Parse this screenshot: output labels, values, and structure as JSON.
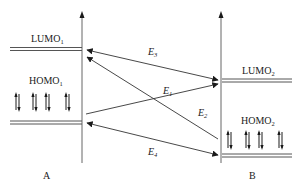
{
  "diagram": {
    "colors": {
      "line": "#555555",
      "axis": "#666666",
      "text": "#1a1a1a",
      "arrow": "#1a1a1a",
      "background": "#ffffff"
    },
    "molecules": [
      {
        "id": "A",
        "label": "A"
      },
      {
        "id": "B",
        "label": "B"
      }
    ],
    "levels": {
      "lumo1": {
        "base": "LUMO",
        "sub": "1"
      },
      "homo1": {
        "base": "HOMO",
        "sub": "1"
      },
      "lumo2": {
        "base": "LUMO",
        "sub": "2"
      },
      "homo2": {
        "base": "HOMO",
        "sub": "2"
      }
    },
    "transitions": [
      {
        "id": "E1",
        "base": "E",
        "sub": "1",
        "from": "HOMO1",
        "to": "LUMO2"
      },
      {
        "id": "E2",
        "base": "E",
        "sub": "2",
        "from": "HOMO2",
        "to": "LUMO1"
      },
      {
        "id": "E3",
        "base": "E",
        "sub": "3",
        "between": [
          "LUMO1",
          "LUMO2"
        ]
      },
      {
        "id": "E4",
        "base": "E",
        "sub": "4",
        "between": [
          "HOMO1",
          "HOMO2"
        ]
      }
    ],
    "electron_pairs": {
      "homo1_count": 4,
      "homo2_count": 4,
      "symbol": "up-down-spin-pair"
    }
  }
}
